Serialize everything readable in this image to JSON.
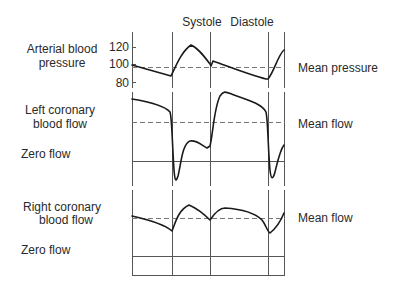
{
  "phases": {
    "systole": "Systole",
    "diastole": "Diastole"
  },
  "panels": {
    "arterial": {
      "label_line1": "Arterial blood",
      "label_line2": "pressure",
      "y_ticks": [
        "120",
        "100",
        "80"
      ],
      "mean_label": "Mean pressure"
    },
    "left_coronary": {
      "label_line1": "Left coronary",
      "label_line2": "blood flow",
      "zero_label": "Zero flow",
      "mean_label": "Mean flow"
    },
    "right_coronary": {
      "label_line1": "Right coronary",
      "label_line2": "blood flow",
      "zero_label": "Zero flow",
      "mean_label": "Mean flow"
    }
  },
  "colors": {
    "trace": "#1a1a1a",
    "grid": "#555555",
    "dashed": "#777777",
    "text": "#2a2a2a"
  }
}
